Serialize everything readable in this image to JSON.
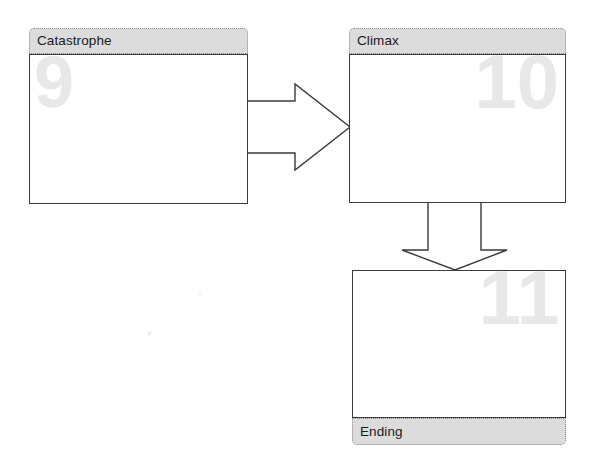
{
  "diagram": {
    "background_color": "#ffffff",
    "node_header_color": "#dcdcdc",
    "node_border_color": "#3a3a3a",
    "watermark_color": "#e8e8e8",
    "nodes": [
      {
        "id": "catastrophe",
        "label": "Catastrophe",
        "number": "9",
        "label_position": "top",
        "number_align": "left",
        "x": 29,
        "y": 28,
        "width": 219,
        "height": 176,
        "header_height": 26,
        "number_size": 72
      },
      {
        "id": "climax",
        "label": "Climax",
        "number": "10",
        "label_position": "top",
        "number_align": "right",
        "x": 349,
        "y": 28,
        "width": 217,
        "height": 175,
        "header_height": 26,
        "number_size": 76
      },
      {
        "id": "ending",
        "label": "Ending",
        "number": "11",
        "label_position": "bottom",
        "number_align": "right",
        "x": 352,
        "y": 270,
        "width": 214,
        "height": 175,
        "header_height": 27,
        "number_size": 76
      }
    ],
    "connectors": [
      {
        "id": "catastrophe-to-climax",
        "from": "catastrophe",
        "to": "climax",
        "direction": "right",
        "shape": "block-arrow"
      },
      {
        "id": "climax-to-ending",
        "from": "climax",
        "to": "ending",
        "direction": "down",
        "shape": "block-arrow"
      }
    ]
  }
}
